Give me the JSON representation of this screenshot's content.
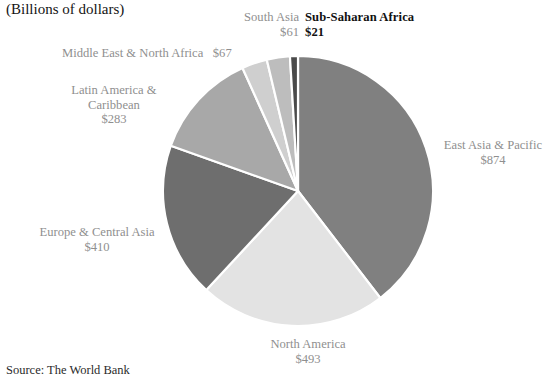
{
  "header": {
    "clipped_title": "",
    "subtitle": "(Billions of dollars)"
  },
  "footer": {
    "source": "Source: The World Bank"
  },
  "chart_data": {
    "type": "pie",
    "title": "",
    "subtitle": "(Billions of dollars)",
    "units": "Billions of dollars",
    "currency_symbol": "$",
    "source": "Source: The World Bank",
    "total": 2209,
    "legend": "none",
    "labels_position": "outside",
    "start_angle_deg": 0,
    "direction": "clockwise",
    "categories": [
      "East Asia & Pacific",
      "North America",
      "Europe & Central Asia",
      "Latin America & Caribbean",
      "Middle East & North Africa",
      "South Asia",
      "Sub-Saharan Africa"
    ],
    "values": [
      874,
      493,
      410,
      283,
      67,
      61,
      21
    ],
    "value_labels": [
      "$874",
      "$493",
      "$410",
      "$283",
      "$67",
      "$61",
      "$21"
    ],
    "colors": [
      "#808080",
      "#e3e3e3",
      "#6e6e6e",
      "#a8a8a8",
      "#cfcfcf",
      "#bdbdbd",
      "#4a4a4a"
    ],
    "slices": [
      {
        "name": "East Asia & Pacific",
        "value": 874,
        "value_label": "$874",
        "color": "#808080",
        "emphasis": "normal"
      },
      {
        "name": "North America",
        "value": 493,
        "value_label": "$493",
        "color": "#e3e3e3",
        "emphasis": "normal"
      },
      {
        "name": "Europe & Central Asia",
        "value": 410,
        "value_label": "$410",
        "color": "#6e6e6e",
        "emphasis": "normal"
      },
      {
        "name": "Latin America & Caribbean",
        "value": 283,
        "value_label": "$283",
        "color": "#a8a8a8",
        "emphasis": "normal"
      },
      {
        "name": "Middle East & North Africa",
        "value": 67,
        "value_label": "$67",
        "color": "#cfcfcf",
        "emphasis": "normal"
      },
      {
        "name": "South Asia",
        "value": 61,
        "value_label": "$61",
        "color": "#bdbdbd",
        "emphasis": "normal"
      },
      {
        "name": "Sub-Saharan Africa",
        "value": 21,
        "value_label": "$21",
        "color": "#4a4a4a",
        "emphasis": "bold"
      }
    ],
    "geometry": {
      "center_x": 298,
      "center_y": 191,
      "radius": 135,
      "separator_color": "#ffffff",
      "separator_width": 2.2
    }
  },
  "labels": {
    "south_asia": {
      "name": "South Asia",
      "value": "$61"
    },
    "ssa": {
      "name": "Sub-Saharan Africa",
      "value": "$21"
    },
    "mena": {
      "name": "Middle East & North Africa",
      "value": "$67"
    },
    "lac_line1": "Latin America &",
    "lac_line2": "Caribbean",
    "lac_value": "$283",
    "eca": {
      "name": "Europe & Central Asia",
      "value": "$410"
    },
    "eap": {
      "name": "East Asia & Pacific",
      "value": "$874"
    },
    "na": {
      "name": "North America",
      "value": "$493"
    }
  }
}
